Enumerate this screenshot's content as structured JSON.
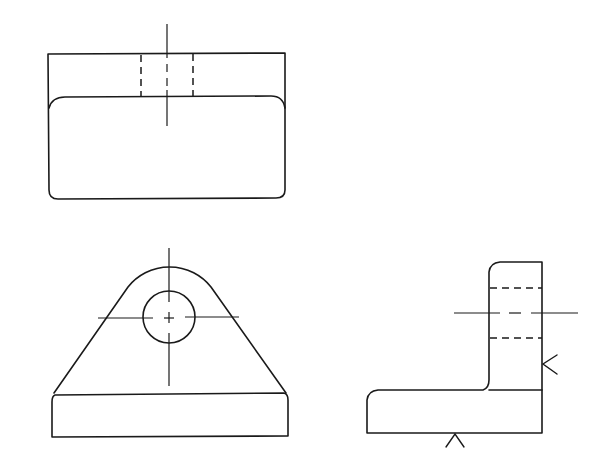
{
  "drawing": {
    "type": "orthographic-projection",
    "views": [
      {
        "id": "top-view",
        "label": "Top view"
      },
      {
        "id": "front-view",
        "label": "Front view"
      },
      {
        "id": "side-view",
        "label": "Side view"
      }
    ],
    "colors": {
      "background": "#ffffff",
      "line": "#1a1a1a"
    },
    "line_types": [
      "visible-outline",
      "hidden-dashed",
      "center-line",
      "viewing-direction-arrow"
    ],
    "top_view": {
      "outer_rect": {
        "x": 48,
        "y": 54,
        "w": 237,
        "h": 145
      },
      "inner_edge_y": 97,
      "hidden_hole_edges_x": [
        141,
        193
      ],
      "centerline_x": 167,
      "centerline_y_range": [
        24,
        126
      ]
    },
    "front_view": {
      "hole_center": {
        "x": 169,
        "y": 317
      },
      "hole_radius": 26,
      "boss_arc_radius": 53,
      "base": {
        "x": 51,
        "y": 395,
        "w": 237,
        "h": 42
      },
      "h_centerline_x_range": [
        98,
        239
      ],
      "v_centerline_y_range": [
        248,
        386
      ]
    },
    "side_view": {
      "upright": {
        "x": 489,
        "y": 262,
        "w": 53
      },
      "base": {
        "x": 367,
        "y": 390,
        "w": 175,
        "h": 43
      },
      "hidden_lines_y": [
        288,
        338
      ],
      "centerline_y": 313,
      "centerline_x_range": [
        454,
        578
      ],
      "arrows": [
        {
          "name": "right-direction-arrow",
          "tip": [
            543,
            364
          ]
        },
        {
          "name": "bottom-direction-arrow",
          "tip": [
            455,
            433
          ]
        }
      ]
    }
  }
}
